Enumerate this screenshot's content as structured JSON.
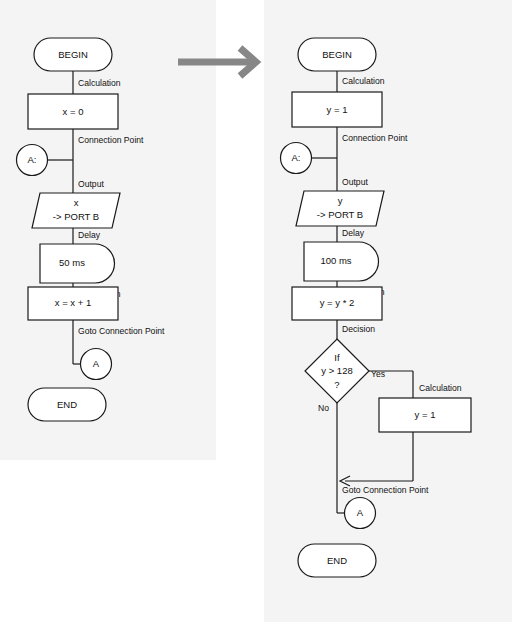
{
  "figure": {
    "type": "flowchart-comparison",
    "transition_arrow": "arrow-right",
    "accent_color": "#878787",
    "shape_fill": "#ffffff",
    "shape_stroke": "#1a1a1a",
    "panel_background": "#f4f4f4"
  },
  "left_chart": {
    "title": "",
    "nodes": [
      {
        "id": "begin",
        "shape": "terminator",
        "label": "BEGIN"
      },
      {
        "id": "calc1",
        "shape": "process",
        "label": "x = 0"
      },
      {
        "id": "conn",
        "shape": "connector",
        "label": "A:"
      },
      {
        "id": "out",
        "shape": "parallelogram",
        "label_line1": "x",
        "label_line2": "-> PORT B"
      },
      {
        "id": "delay",
        "shape": "delay",
        "label": "50 ms"
      },
      {
        "id": "calc2",
        "shape": "process",
        "label": "x = x + 1"
      },
      {
        "id": "goto",
        "shape": "connector",
        "label": "A"
      },
      {
        "id": "end",
        "shape": "terminator",
        "label": "END"
      }
    ],
    "edge_labels": [
      "Calculation",
      "Connection Point",
      "Output",
      "Delay",
      "Calculation",
      "Goto Connection Point"
    ]
  },
  "right_chart": {
    "title": "",
    "nodes": [
      {
        "id": "begin",
        "shape": "terminator",
        "label": "BEGIN"
      },
      {
        "id": "calc1",
        "shape": "process",
        "label": "y = 1"
      },
      {
        "id": "conn",
        "shape": "connector",
        "label": "A:"
      },
      {
        "id": "out",
        "shape": "parallelogram",
        "label_line1": "y",
        "label_line2": "-> PORT B"
      },
      {
        "id": "delay",
        "shape": "delay",
        "label": "100 ms"
      },
      {
        "id": "calc2",
        "shape": "process",
        "label": "y = y * 2"
      },
      {
        "id": "dec",
        "shape": "diamond",
        "label_line1": "If",
        "label_line2": "y > 128",
        "label_line3": "?"
      },
      {
        "id": "reset",
        "shape": "process",
        "label": "y = 1"
      },
      {
        "id": "goto",
        "shape": "connector",
        "label": "A"
      },
      {
        "id": "end",
        "shape": "terminator",
        "label": "END"
      }
    ],
    "edge_labels": [
      "Calculation",
      "Connection Point",
      "Output",
      "Delay",
      "Calculation",
      "Decision",
      "Calculation",
      "Goto Connection Point"
    ],
    "branch_labels": {
      "yes": "Yes",
      "no": "No"
    }
  }
}
